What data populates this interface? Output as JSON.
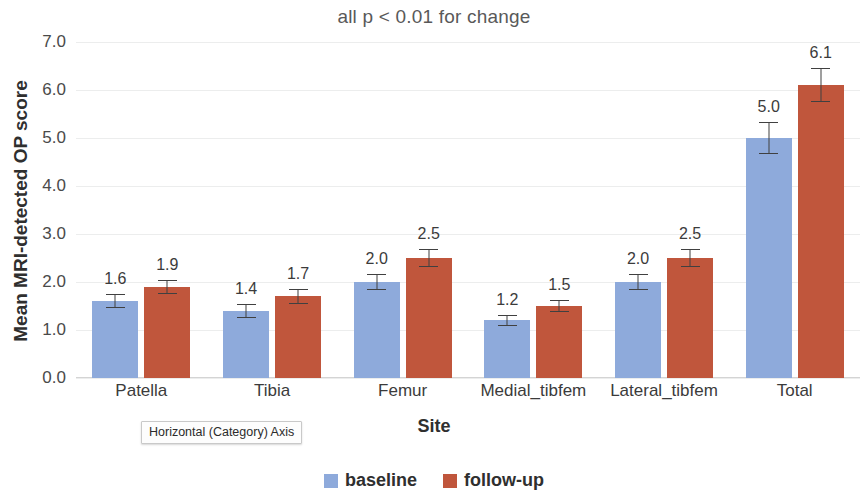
{
  "chart_data": {
    "type": "bar",
    "title": "all p < 0.01 for change",
    "xlabel": "Site",
    "ylabel": "Mean MRI-detected OP score",
    "ylim": [
      0.0,
      7.0
    ],
    "yticks": [
      "0.0",
      "1.0",
      "2.0",
      "3.0",
      "4.0",
      "5.0",
      "6.0",
      "7.0"
    ],
    "grid": true,
    "legend_position": "bottom",
    "categories": [
      "Patella",
      "Tibia",
      "Femur",
      "Medial_tibfem",
      "Lateral_tibfem",
      "Total"
    ],
    "series": [
      {
        "name": "baseline",
        "color": "#8eaadb",
        "values": [
          1.6,
          1.4,
          2.0,
          1.2,
          2.0,
          5.0
        ],
        "labels": [
          "1.6",
          "1.4",
          "2.0",
          "1.2",
          "2.0",
          "5.0"
        ],
        "errors": [
          0.14,
          0.14,
          0.17,
          0.11,
          0.17,
          0.33
        ]
      },
      {
        "name": "follow-up",
        "color": "#c0563c",
        "values": [
          1.9,
          1.7,
          2.5,
          1.5,
          2.5,
          6.1
        ],
        "labels": [
          "1.9",
          "1.7",
          "2.5",
          "1.5",
          "2.5",
          "6.1"
        ],
        "errors": [
          0.15,
          0.15,
          0.18,
          0.12,
          0.18,
          0.36
        ]
      }
    ]
  },
  "tooltip": {
    "text": "Horizontal (Category) Axis"
  },
  "legend": {
    "items": [
      {
        "label": "baseline",
        "color": "#8eaadb"
      },
      {
        "label": "follow-up",
        "color": "#c0563c"
      }
    ]
  }
}
